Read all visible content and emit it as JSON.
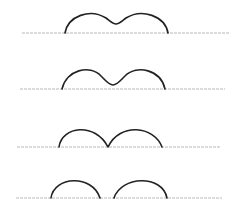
{
  "diagram": {
    "colors": {
      "curve": "#222222",
      "baseline": "#b8b8b8",
      "background": "#ffffff"
    },
    "panels": [
      {
        "id": "stage-1",
        "baseline": {
          "x1": 22,
          "x2": 229,
          "y": 33
        },
        "path": "M65,33 C68,16 90,8 106,18 C110,21 113,24 116,24 C119,24 122,21 126,18 C142,8 165,16 168,33"
      },
      {
        "id": "stage-2",
        "baseline": {
          "x1": 20,
          "x2": 225,
          "y": 89
        },
        "path": "M62,89 C66,70 90,64 101,76 C106,81 109,85 113,85 C117,85 120,81 125,76 C137,64 161,70 165,89"
      },
      {
        "id": "stage-3",
        "baseline": {
          "x1": 17,
          "x2": 221,
          "y": 147
        },
        "path": "M59,147 C62,126 95,122 108,147 C120,122 154,126 162,147"
      },
      {
        "id": "stage-4",
        "baseline": {
          "x1": 16,
          "x2": 222,
          "y": 198
        },
        "path": "M51,198 C54,176 92,174 100,198 M114,198 C121,176 162,174 167,198"
      }
    ]
  }
}
